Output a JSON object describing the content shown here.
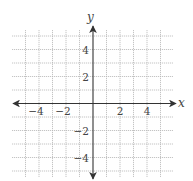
{
  "chart_data": {
    "type": "scatter",
    "title": "",
    "xlabel": "x",
    "ylabel": "y",
    "xlim": [
      -6,
      6
    ],
    "ylim": [
      -6,
      6
    ],
    "grid": true,
    "grid_range_x": [
      -5,
      5
    ],
    "grid_range_y": [
      -5,
      5
    ],
    "x_ticks": [
      -4,
      -2,
      2,
      4
    ],
    "y_ticks": [
      4,
      2,
      -2,
      -4
    ],
    "x_tick_labels": [
      "−4",
      "−2",
      "2",
      "4"
    ],
    "y_tick_labels": [
      "4",
      "2",
      "−2",
      "−4"
    ],
    "series": [],
    "legend": null
  },
  "colors": {
    "grid": "#b5b5b5",
    "axis": "#333333",
    "text": "#444444",
    "background": "#ffffff"
  }
}
